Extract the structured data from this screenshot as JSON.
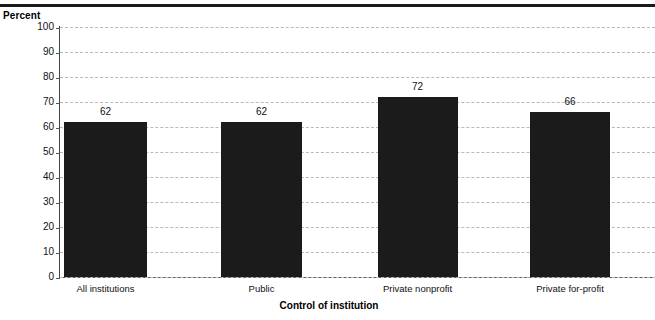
{
  "chart_data": {
    "type": "bar",
    "title": "",
    "subtitle": "",
    "xlabel": "Control of institution",
    "ylabel": "Percent",
    "categories": [
      "All institutions",
      "Public",
      "Private nonprofit",
      "Private for-profit"
    ],
    "values": [
      62,
      62,
      72,
      66
    ],
    "data_labels": [
      "62",
      "62",
      "72",
      "66"
    ],
    "ylim": [
      0,
      100
    ],
    "yticks": [
      0,
      10,
      20,
      30,
      40,
      50,
      60,
      70,
      80,
      90,
      100
    ],
    "ytick_labels": [
      "0",
      "10",
      "20",
      "30",
      "40",
      "50",
      "60",
      "70",
      "80",
      "90",
      "100"
    ],
    "grid": "horizontal-dashed",
    "legend": "none",
    "bar_color": "#1b1b1b",
    "grid_color": "#b9b9b9",
    "axis_color": "#555555",
    "rule_color": "#1a1a1a"
  }
}
